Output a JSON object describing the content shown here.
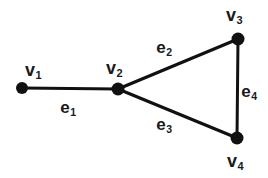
{
  "figure": {
    "name": "undirected-graph-diagram",
    "background_color": "#ffffff",
    "stroke_color": "#111111",
    "text_color": "#1a1a1a",
    "width": 268,
    "height": 178
  },
  "vertices": [
    {
      "id": "v1",
      "label": "v",
      "sub": "1",
      "cx": 22,
      "cy": 88,
      "r": 6.0,
      "label_x": 33,
      "label_y": 70
    },
    {
      "id": "v2",
      "label": "v",
      "sub": "2",
      "cx": 118,
      "cy": 89,
      "r": 6.5,
      "label_x": 114,
      "label_y": 68
    },
    {
      "id": "v3",
      "label": "v",
      "sub": "3",
      "cx": 238,
      "cy": 39,
      "r": 6.5,
      "label_x": 234,
      "label_y": 15
    },
    {
      "id": "v4",
      "label": "v",
      "sub": "4",
      "cx": 237,
      "cy": 138,
      "r": 6.5,
      "label_x": 235,
      "label_y": 161
    }
  ],
  "edges": [
    {
      "id": "e1",
      "label": "e",
      "sub": "1",
      "from": "v1",
      "to": "v2",
      "x1": 22,
      "y1": 88,
      "x2": 118,
      "y2": 89,
      "stroke_width": 3.0,
      "label_x": 68,
      "label_y": 107
    },
    {
      "id": "e2",
      "label": "e",
      "sub": "2",
      "from": "v2",
      "to": "v3",
      "x1": 118,
      "y1": 89,
      "x2": 238,
      "y2": 39,
      "stroke_width": 3.2,
      "label_x": 164,
      "label_y": 47
    },
    {
      "id": "e3",
      "label": "e",
      "sub": "3",
      "from": "v2",
      "to": "v4",
      "x1": 118,
      "y1": 89,
      "x2": 237,
      "y2": 138,
      "stroke_width": 3.2,
      "label_x": 164,
      "label_y": 124
    },
    {
      "id": "e4",
      "label": "e",
      "sub": "4",
      "from": "v3",
      "to": "v4",
      "x1": 238,
      "y1": 39,
      "x2": 237,
      "y2": 138,
      "stroke_width": 3.0,
      "label_x": 249,
      "label_y": 91
    }
  ],
  "labels": {
    "v1": "v",
    "v1_sub": "1",
    "v2": "v",
    "v2_sub": "2",
    "v3": "v",
    "v3_sub": "3",
    "v4": "v",
    "v4_sub": "4",
    "e1": "e",
    "e1_sub": "1",
    "e2": "e",
    "e2_sub": "2",
    "e3": "e",
    "e3_sub": "3",
    "e4": "e",
    "e4_sub": "4"
  }
}
